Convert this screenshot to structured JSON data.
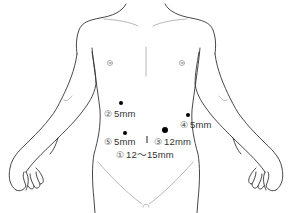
{
  "diagram": {
    "type": "laparoscopic-port-placement",
    "colors": {
      "outline": "#333333",
      "faint_line": "#9a9a9a",
      "port": "#000000",
      "text": "#333333"
    },
    "ports": [
      {
        "id": "1",
        "symbol": "①",
        "size": "12～15mm",
        "marker": "vertical-line",
        "position": "umbilicus"
      },
      {
        "id": "2",
        "symbol": "②",
        "size": "5mm",
        "marker": "dot",
        "position": "right upper abdomen"
      },
      {
        "id": "3",
        "symbol": "③",
        "size": "12mm",
        "marker": "large-dot",
        "position": "left mid abdomen"
      },
      {
        "id": "4",
        "symbol": "④",
        "size": "5mm",
        "marker": "dot",
        "position": "left flank"
      },
      {
        "id": "5",
        "symbol": "⑤",
        "size": "5mm",
        "marker": "dot",
        "position": "right mid abdomen"
      }
    ]
  }
}
